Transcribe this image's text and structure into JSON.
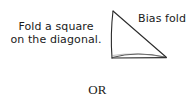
{
  "figure": {
    "background_color": "#ffffff",
    "ink_color": "#1a1a1a",
    "instruction": {
      "line1": "Fold a square",
      "line2": "on the diagonal."
    },
    "bias_label": "Bias fold",
    "or_label": "OR",
    "diagram": {
      "shape_name": "right-triangle",
      "description": "folded square shown as a right triangle with a bowed fabric fold along the bottom edge",
      "apex": {
        "x": 9,
        "y": 7
      },
      "bottom_left": {
        "x": 8,
        "y": 54
      },
      "bottom_right": {
        "x": 62,
        "y": 53
      },
      "fold_arc_control": {
        "x": 33,
        "y": 47
      },
      "stroke_color": "#2b2b2b",
      "stroke_width": 1.1
    }
  }
}
